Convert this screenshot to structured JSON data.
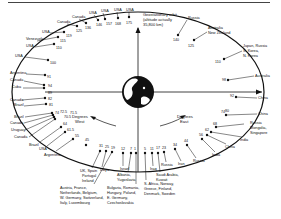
{
  "diagram": {
    "title_note": "Geostationary orbit (altitude actually 35,800 km)",
    "direction_labels": {
      "west": [
        "Degrees",
        "West"
      ],
      "east": [
        "Degrees",
        "East"
      ]
    },
    "west_satellites": [
      {
        "deg": "175",
        "label": "USA"
      },
      {
        "deg": "168",
        "label": "USA"
      },
      {
        "deg": "157",
        "label": "USA"
      },
      {
        "deg": "146",
        "label": "USA"
      },
      {
        "deg": "136",
        "label": "Canada"
      },
      {
        "deg": "125",
        "label": "Canada"
      },
      {
        "deg": "119",
        "label": "USA"
      },
      {
        "deg": "115",
        "label": "Venezuela"
      },
      {
        "deg": "110",
        "label": "USA"
      },
      {
        "deg": "100",
        "label": "USA"
      },
      {
        "deg": "91",
        "label": "Argentina"
      },
      {
        "deg": "84",
        "label": "Canada"
      },
      {
        "deg": "89",
        "label": "Cuba"
      },
      {
        "deg": "82",
        "label": "Canada"
      },
      {
        "deg": "81",
        "label": "Brazil"
      },
      {
        "deg": "74",
        "label": "Brazil"
      },
      {
        "deg": "72.5",
        "label": "Canada"
      },
      {
        "deg": "71.5",
        "label": "Uruguay"
      },
      {
        "deg": "70.5",
        "label": "Canada"
      },
      {
        "deg": "64",
        "label": "Brazil"
      },
      {
        "deg": "61.5",
        "label": "USA"
      },
      {
        "deg": "55",
        "label": "Argentina"
      },
      {
        "deg": "45",
        "label": ""
      },
      {
        "deg": "31",
        "label": "UK, Spain, Portugal, Ireland"
      },
      {
        "deg": "25",
        "label": "Libya"
      },
      {
        "deg": "19",
        "label": "Austria, France, Netherlands, Belgium, W. Germany, Switzerland, Italy, Luxembourg"
      },
      {
        "deg": "12",
        "label": "Israel"
      },
      {
        "deg": "7",
        "label": "Albania, Yugoslavia"
      },
      {
        "deg": "1",
        "label": "Bulgaria, Romania, Hungary, Poland, E. Germany, Czechoslovakia"
      }
    ],
    "east_satellites": [
      {
        "deg": "5",
        "label": "S. Africa, Norway, Greece, Finland, Denmark, Sweden"
      },
      {
        "deg": "11",
        "label": "Iraq"
      },
      {
        "deg": "17",
        "label": "Saudi Arabia, Kuwait"
      },
      {
        "deg": "23",
        "label": "Russia"
      },
      {
        "deg": "34",
        "label": "Iran"
      },
      {
        "deg": "44",
        "label": "Russia"
      },
      {
        "deg": "56",
        "label": "India"
      },
      {
        "deg": "62",
        "label": "China"
      },
      {
        "deg": "68",
        "label": "India"
      },
      {
        "deg": "74",
        "label": "Russia, Mongolia, Singapore"
      },
      {
        "deg": "80",
        "label": "China"
      },
      {
        "deg": "92",
        "label": "China"
      },
      {
        "deg": "98",
        "label": "Australia"
      },
      {
        "deg": "110",
        "label": "Japan, Russia, S. Korea, N. Korea"
      },
      {
        "deg": "125",
        "label": "Australia, New Zealand"
      },
      {
        "deg": "140",
        "label": "Russia"
      }
    ],
    "labels": {
      "geo_line1": "Geostationary orbit",
      "geo_line2": "(altitude actually",
      "geo_line3": "35,800 km)",
      "w_degrees": "Degrees",
      "w_west": "West",
      "e_degrees": "Degrees",
      "e_east": "East",
      "t175": "175",
      "t168": "168",
      "t157": "157",
      "t146": "146",
      "t136": "136",
      "t125w": "125",
      "t119": "119",
      "t115": "115",
      "t110w": "110",
      "t100": "100",
      "t91": "91",
      "t94": "94",
      "t89": "89",
      "t82": "82",
      "t81": "81",
      "t74w": "74",
      "t725": "72.5",
      "t715": "71.5",
      "t705": "70.5",
      "t64": "64",
      "t615": "61.5",
      "t55": "55",
      "t45": "45",
      "t31": "31",
      "t25": "25",
      "t19": "19",
      "t12": "12",
      "t7": "7",
      "t1": "1",
      "t5": "5",
      "t11": "11",
      "t17": "17",
      "t23": "23",
      "t34": "34",
      "t44": "44",
      "t56": "56",
      "t62": "62",
      "t68": "68",
      "t74e": "74",
      "t80": "80",
      "t92": "92",
      "t98": "98",
      "t110e": "110",
      "t125e": "125",
      "t140": "140",
      "c_usa1": "USA",
      "c_usa2": "USA",
      "c_usa3": "USA",
      "c_usa4": "USA",
      "c_canada1": "Canada",
      "c_canada2": "Canada",
      "c_usa5": "USA",
      "c_venezuela": "Venezuela",
      "c_usa6": "USA",
      "c_usa7": "USA",
      "c_argentina1": "Argentina",
      "c_canada3": "Canada",
      "c_cuba": "Cuba",
      "c_canada4": "Canada",
      "c_brazil1": "Brazil",
      "c_brazil2": "Brazil",
      "c_canada5": "Canada",
      "c_uruguay": "Uruguay",
      "c_canada6": "Canada",
      "c_brazil3": "Brazil",
      "c_usa8": "USA",
      "c_argentina2": "Argentina",
      "c_uk1": "UK, Spain",
      "c_uk2": "Portugal",
      "c_uk3": "Ireland",
      "c_libya": "Libya",
      "c_eu1": "Austria, France,",
      "c_eu2": "Netherlands, Belgium,",
      "c_eu3": "W. Germany, Switzerland,",
      "c_eu4": "Italy, Luxembourg",
      "c_israel": "Israel",
      "c_alb1": "Albania,",
      "c_alb2": "Yugoslavia",
      "c_bul1": "Bulgaria, Romania,",
      "c_bul2": "Hungary, Poland,",
      "c_bul3": "E. Germany,",
      "c_bul4": "Czechoslovakia",
      "c_saf1": "S. Africa, Norway,",
      "c_saf2": "Greece, Finland,",
      "c_saf3": "Denmark, Sweden",
      "c_iraq": "Iraq",
      "c_saudi1": "Saudi Arabia,",
      "c_saudi2": "Kuwait",
      "c_russia1": "Russia",
      "c_iran": "Iran",
      "c_russia2": "Russia",
      "c_india1": "India",
      "c_china1": "China",
      "c_india2": "India",
      "c_rus3a": "Russia",
      "c_rus3b": "Mongolia,",
      "c_rus3c": "Singapore",
      "c_china2": "China",
      "c_china3": "China",
      "c_australia": "Australia",
      "c_jp1": "Japan, Russia",
      "c_jp2": "S. Korea,",
      "c_jp3": "N. Korea",
      "c_aunz1": "Australia",
      "c_aunz2": "New Zealand",
      "c_russia4": "Russia"
    }
  }
}
